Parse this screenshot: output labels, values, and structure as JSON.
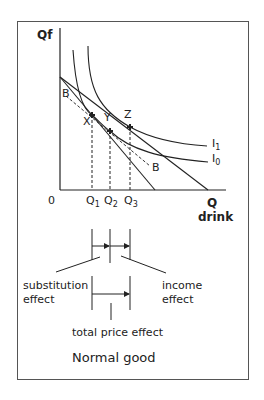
{
  "diagram": {
    "type": "indifference-curve",
    "y_axis_label": "Qf",
    "x_axis_label_line1": "Q",
    "x_axis_label_line2": "drink",
    "origin_label": "0",
    "quantity_ticks": [
      {
        "base": "Q",
        "sub": "1"
      },
      {
        "base": "Q",
        "sub": "2"
      },
      {
        "base": "Q",
        "sub": "3"
      }
    ],
    "points": {
      "x": "X",
      "y": "Y",
      "z": "Z"
    },
    "budget_label_left": "B",
    "budget_label_right": "B",
    "curves": [
      {
        "base": "I",
        "sub": "1"
      },
      {
        "base": "I",
        "sub": "0"
      }
    ],
    "effects": {
      "substitution_line1": "substitution",
      "substitution_line2": "effect",
      "income_line1": "income",
      "income_line2": "effect",
      "total": "total price effect"
    },
    "caption": "Normal good",
    "colors": {
      "line": "#222222",
      "frame": "#555555",
      "background": "#ffffff"
    }
  }
}
